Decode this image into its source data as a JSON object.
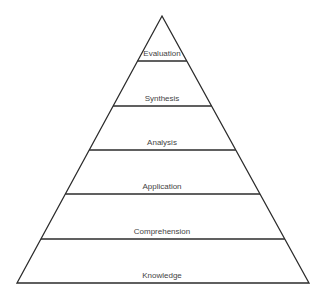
{
  "diagram": {
    "type": "pyramid",
    "colors": {
      "stroke": "#2b2b2b",
      "fill": "#ffffff",
      "text": "#444444"
    },
    "apex": {
      "x": 162,
      "y": 16
    },
    "base": {
      "left_x": 17,
      "right_x": 309,
      "y": 283
    },
    "levels": [
      {
        "label": "Evaluation",
        "bottom_y": 61
      },
      {
        "label": "Synthesis",
        "bottom_y": 106
      },
      {
        "label": "Analysis",
        "bottom_y": 150
      },
      {
        "label": "Application",
        "bottom_y": 194
      },
      {
        "label": "Comprehension",
        "bottom_y": 239
      },
      {
        "label": "Knowledge",
        "bottom_y": 283
      }
    ]
  }
}
